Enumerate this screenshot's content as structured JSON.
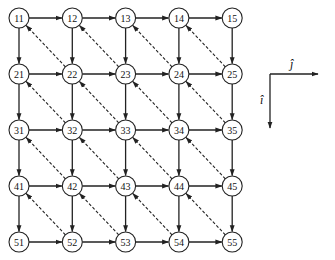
{
  "diagram": {
    "grid": {
      "rows": 5,
      "cols": 5,
      "origin_x": 19,
      "origin_y": 18,
      "dx": 53.3,
      "dy": 56,
      "node_radius": 10
    },
    "nodes": [
      [
        "11",
        "12",
        "13",
        "14",
        "15"
      ],
      [
        "21",
        "22",
        "23",
        "24",
        "25"
      ],
      [
        "31",
        "32",
        "33",
        "34",
        "35"
      ],
      [
        "41",
        "42",
        "43",
        "44",
        "45"
      ],
      [
        "51",
        "52",
        "53",
        "54",
        "55"
      ]
    ],
    "edges": {
      "solid_horizontal": "each node (i,j) -> (i,j+1), arrow pointing right",
      "solid_vertical": "each node (i,j) -> (i+1,j), arrow pointing down",
      "dashed_diagonal": "each node (i+1,j+1) -> (i,j), arrow pointing up-left"
    },
    "axes": {
      "j_label": "ĵ",
      "i_label": "î",
      "corner_x": 270,
      "corner_y": 74,
      "j_end_x": 318,
      "i_end_y": 128
    },
    "colors": {
      "stroke": "#222222",
      "background": "#ffffff"
    }
  }
}
